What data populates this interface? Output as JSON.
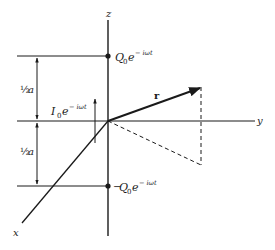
{
  "diagram": {
    "type": "oscillating-dipole-geometry",
    "axes": {
      "z_label": "z",
      "y_label": "y",
      "x_label": "x"
    },
    "vector": {
      "label": "r"
    },
    "charges": {
      "top": {
        "symbol": "Q",
        "subscript": "0",
        "exp_base": "e",
        "exponent": "− iωt",
        "sign": ""
      },
      "bottom": {
        "symbol": "Q",
        "subscript": "0",
        "exp_base": "e",
        "exponent": "− iωt",
        "sign": "−"
      }
    },
    "current": {
      "symbol": "I",
      "subscript": "0",
      "exp_base": "e",
      "exponent": "− iωt"
    },
    "dimensions": {
      "upper_half": {
        "fraction": "½",
        "var": "a"
      },
      "lower_half": {
        "fraction": "½",
        "var": "a"
      }
    },
    "colors": {
      "line": "#1a1a1a",
      "background": "#ffffff"
    }
  }
}
